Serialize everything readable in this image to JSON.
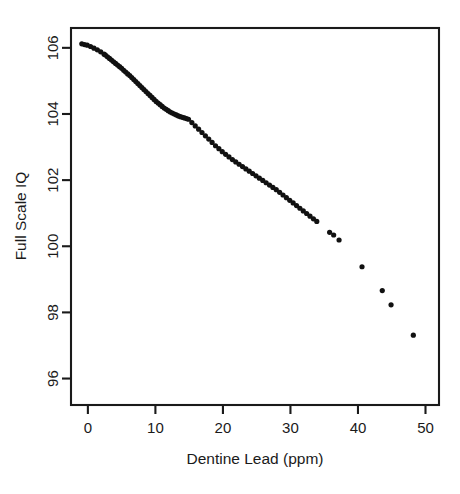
{
  "figure": {
    "width": 460,
    "height": 494,
    "background": "#ffffff",
    "foreground": "#1a1a1a"
  },
  "chart_data": {
    "type": "scatter",
    "title": "",
    "xlabel": "Dentine Lead (ppm)",
    "ylabel": "Full Scale IQ",
    "xlim": [
      -2.5,
      52.0
    ],
    "ylim": [
      95.2,
      106.6
    ],
    "xticks": [
      0,
      10,
      20,
      30,
      40,
      50
    ],
    "yticks": [
      96,
      98,
      100,
      102,
      104,
      106
    ],
    "xticklabels": [
      "0",
      "10",
      "20",
      "30",
      "40",
      "50"
    ],
    "yticklabels": [
      "96",
      "98",
      "100",
      "102",
      "104",
      "106"
    ],
    "grid": false,
    "legend": null,
    "point_color": "#111111",
    "point_size": 2.6,
    "series": [
      {
        "name": "Adjusted Full Scale IQ",
        "x": [
          -0.9,
          -0.5,
          -0.1,
          0.4,
          0.9,
          1.4,
          1.9,
          2.4,
          2.6,
          2.9,
          3.2,
          3.5,
          3.8,
          4.1,
          4.4,
          4.7,
          5.0,
          5.3,
          5.6,
          5.9,
          6.2,
          6.5,
          6.8,
          7.1,
          7.4,
          7.7,
          8.0,
          8.3,
          8.6,
          8.9,
          9.2,
          9.5,
          9.8,
          10.1,
          10.4,
          10.7,
          11.0,
          11.3,
          11.6,
          11.9,
          12.2,
          12.5,
          12.8,
          13.1,
          13.4,
          13.7,
          14.0,
          14.3,
          14.6,
          14.9,
          15.4,
          15.9,
          16.4,
          16.9,
          17.4,
          17.9,
          18.4,
          18.9,
          19.4,
          19.9,
          20.4,
          20.9,
          21.4,
          21.9,
          22.4,
          22.9,
          23.4,
          23.9,
          24.4,
          24.9,
          25.4,
          25.9,
          26.4,
          26.9,
          27.4,
          27.9,
          28.4,
          28.9,
          29.4,
          29.9,
          30.4,
          30.9,
          31.4,
          31.9,
          32.4,
          32.9,
          33.4,
          33.9,
          35.8,
          36.4,
          37.2,
          40.6,
          43.6,
          44.9,
          48.2
        ],
        "y": [
          106.12,
          106.1,
          106.08,
          106.04,
          105.99,
          105.94,
          105.88,
          105.81,
          105.78,
          105.73,
          105.68,
          105.63,
          105.58,
          105.53,
          105.48,
          105.43,
          105.38,
          105.32,
          105.27,
          105.21,
          105.16,
          105.1,
          105.04,
          104.98,
          104.92,
          104.86,
          104.8,
          104.74,
          104.68,
          104.62,
          104.56,
          104.5,
          104.44,
          104.38,
          104.33,
          104.28,
          104.23,
          104.18,
          104.14,
          104.1,
          104.06,
          104.03,
          104.0,
          103.97,
          103.94,
          103.92,
          103.9,
          103.88,
          103.86,
          103.84,
          103.74,
          103.64,
          103.54,
          103.44,
          103.34,
          103.24,
          103.14,
          103.04,
          102.95,
          102.86,
          102.78,
          102.7,
          102.62,
          102.55,
          102.48,
          102.41,
          102.34,
          102.27,
          102.2,
          102.13,
          102.06,
          101.99,
          101.92,
          101.85,
          101.78,
          101.71,
          101.63,
          101.55,
          101.47,
          101.39,
          101.31,
          101.23,
          101.15,
          101.07,
          100.99,
          100.91,
          100.83,
          100.75,
          100.42,
          100.34,
          100.19,
          99.38,
          98.66,
          98.23,
          97.31
        ]
      }
    ]
  }
}
